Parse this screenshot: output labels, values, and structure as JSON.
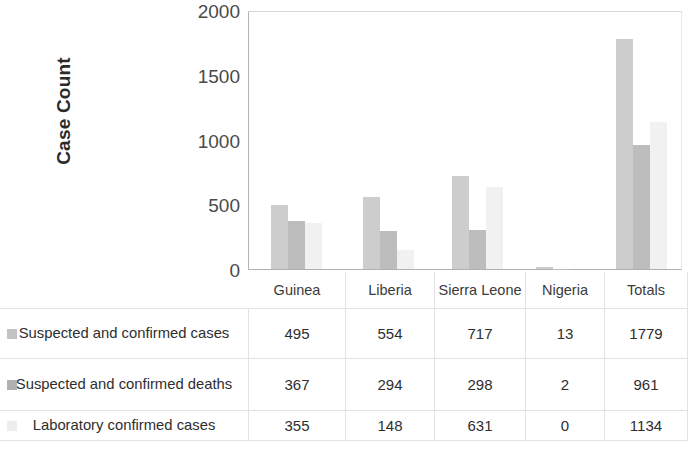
{
  "chart_data": {
    "type": "bar",
    "title": "",
    "xlabel": "",
    "ylabel": "Case Count",
    "ylim": [
      0,
      2000
    ],
    "yticks": [
      0,
      500,
      1000,
      1500,
      2000
    ],
    "grid": false,
    "legend_position": "table-left",
    "categories": [
      "Guinea",
      "Liberia",
      "Sierra Leone",
      "Nigeria",
      "Totals"
    ],
    "series": [
      {
        "name": "Suspected and confirmed cases",
        "color": "#cdcdcd",
        "values": [
          495,
          554,
          717,
          13,
          1779
        ]
      },
      {
        "name": "Suspected and confirmed deaths",
        "color": "#bdbdbd",
        "values": [
          367,
          294,
          298,
          2,
          961
        ]
      },
      {
        "name": "Laboratory confirmed cases",
        "color": "#f1f1f1",
        "values": [
          355,
          148,
          631,
          0,
          1134
        ]
      }
    ]
  },
  "axis": {
    "y_title": "Case Count",
    "y_tick_labels": [
      "2000",
      "1500",
      "1000",
      "500",
      "0"
    ]
  },
  "table": {
    "corner_label": "",
    "column_headers": [
      "Guinea",
      "Liberia",
      "Sierra Leone",
      "Nigeria",
      "Totals"
    ],
    "rows": [
      {
        "label": "Suspected and confirmed cases",
        "swatch_color": "#c3c3c3",
        "values": [
          "495",
          "554",
          "717",
          "13",
          "1779"
        ]
      },
      {
        "label": "Suspected and confirmed deaths",
        "swatch_color": "#b0b0b0",
        "values": [
          "367",
          "294",
          "298",
          "2",
          "961"
        ]
      },
      {
        "label": "Laboratory confirmed cases",
        "swatch_color": "#ededed",
        "values": [
          "355",
          "148",
          "631",
          "0",
          "1134"
        ]
      }
    ]
  }
}
